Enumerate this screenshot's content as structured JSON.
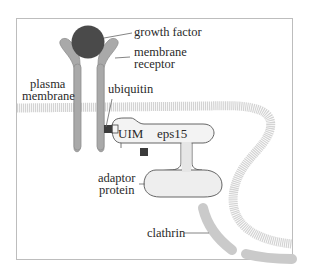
{
  "diagram": {
    "type": "biology-schematic",
    "labels": {
      "growth_factor": "growth factor",
      "membrane_receptor_line1": "membrane",
      "membrane_receptor_line2": "receptor",
      "plasma_membrane_line1": "plasma",
      "plasma_membrane_line2": "membrane",
      "ubiquitin": "ubiquitin",
      "uim": "UIM",
      "eps15": "eps15",
      "adaptor_protein_line1": "adaptor",
      "adaptor_protein_line2": "protein",
      "clathrin": "clathrin"
    },
    "colors": {
      "background": "#ffffff",
      "frame": "#b8b8b8",
      "panel": "#ffffff",
      "growth_factor": "#4a4a4a",
      "receptor": "#a9a9a9",
      "receptor_outline": "#8c8c8c",
      "membrane": "#d2d2d2",
      "protein_fill": "#f2f2f2",
      "protein_outline": "#555555",
      "ubiquitin": "#3d3d3d",
      "clathrin": "#c9c9c9",
      "leader_line": "#555555"
    }
  }
}
